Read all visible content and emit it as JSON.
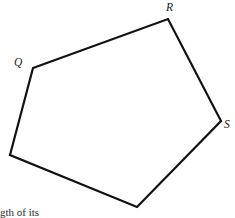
{
  "figure": {
    "name": "labeled-pentagon",
    "background_color": "#ffffff",
    "stroke_color": "#111111",
    "stroke_width": 2.2,
    "fill_color": "none",
    "width": 235,
    "height": 218,
    "vertices": [
      {
        "id": "Q",
        "label": "Q",
        "x": 33,
        "y": 68,
        "labeled": true,
        "label_x": 14,
        "label_y": 57
      },
      {
        "id": "R",
        "label": "R",
        "x": 168,
        "y": 19,
        "labeled": true,
        "label_x": 166,
        "label_y": 2
      },
      {
        "id": "S",
        "label": "S",
        "x": 221,
        "y": 121,
        "labeled": true,
        "label_x": 224,
        "label_y": 119
      },
      {
        "id": "V4",
        "label": "",
        "x": 137,
        "y": 207,
        "labeled": false
      },
      {
        "id": "V5",
        "label": "",
        "x": 10,
        "y": 155,
        "labeled": false
      }
    ],
    "edges": [
      {
        "from": "Q",
        "to": "R"
      },
      {
        "from": "R",
        "to": "S"
      },
      {
        "from": "S",
        "to": "V4"
      },
      {
        "from": "V4",
        "to": "V5"
      },
      {
        "from": "V5",
        "to": "Q"
      }
    ],
    "path_d": "M 33 68 L 168 19 L 221 121 L 137 207 L 10 155 Z"
  },
  "caption": {
    "clipped_text": "gth of its",
    "note": "partially cut off at bottom edge of image"
  }
}
